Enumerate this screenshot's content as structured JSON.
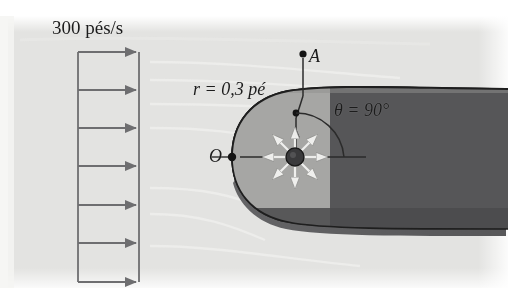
{
  "figure": {
    "title_alt": "Escoamento uniforme sobre meio-corpo de Rankine",
    "labels": {
      "freestream_velocity": "300 pés/s",
      "radius": "r = 0,3 pé",
      "theta": "θ = 90°",
      "point_a": "A",
      "point_o": "O"
    },
    "colors": {
      "background_paper": "#e3e3e1",
      "body_fill_light": "#a8a8a6",
      "body_fill_dark": "#58585a",
      "outline": "#2b2b2b",
      "arrow_gray": "#6e6e70",
      "source_hub": "#3a3a3c",
      "source_arrow": "#f2f2f0",
      "page_white": "#ffffff"
    },
    "velocity_rake": {
      "arrow_count": 7,
      "arrow_y": [
        52,
        90,
        128,
        166,
        205,
        243,
        282
      ],
      "x_start": 78,
      "x_end": 140,
      "orientation": "horizontal-right"
    },
    "source": {
      "center_x": 295,
      "center_y": 157,
      "ray_count": 8,
      "hub_radius": 9,
      "description": "fonte pontual com oito setas radiais"
    },
    "stagnation_point": {
      "x": 232,
      "y": 157
    },
    "radius_point": {
      "x": 296,
      "y": 113
    },
    "point_a_marker": {
      "x": 303,
      "y": 54
    },
    "angle_arc": {
      "radius": 48,
      "from_deg": 90,
      "to_deg": 0
    }
  }
}
